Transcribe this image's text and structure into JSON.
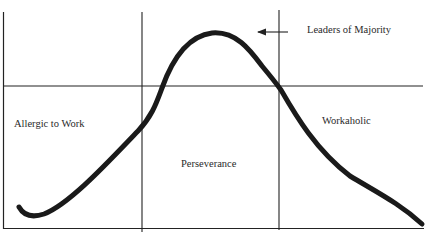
{
  "diagram": {
    "type": "work-attitude-curve",
    "labels": {
      "leaders": "Leaders of Majority",
      "allergic": "Allergic to Work",
      "perseverance": "Perseverance",
      "workaholic": "Workaholic"
    },
    "regions": [
      "Allergic to Work",
      "Perseverance",
      "Workaholic"
    ],
    "annotation_arrow": {
      "points_to": "curve peak",
      "label": "Leaders of Majority"
    },
    "colors": {
      "line": "#222222",
      "curve": "#1a1a1a",
      "text": "#2a2a2a",
      "background": "#ffffff"
    }
  }
}
